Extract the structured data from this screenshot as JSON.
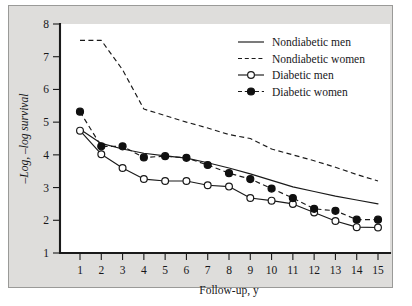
{
  "figure": {
    "background_color": "#dedddb",
    "plot_background_color": "#ffffff",
    "line_color": "#1a1a1a"
  },
  "chart_data": {
    "type": "line",
    "title": "",
    "xlabel": "Follow-up, y",
    "ylabel": "–Log, –log survival",
    "xlim": [
      1,
      15
    ],
    "ylim": [
      1,
      8
    ],
    "grid": false,
    "legend_position": "top-right",
    "x": [
      1,
      2,
      3,
      4,
      5,
      6,
      7,
      8,
      9,
      10,
      11,
      12,
      13,
      14,
      15
    ],
    "xticks": [
      "1",
      "2",
      "3",
      "4",
      "5",
      "6",
      "7",
      "8",
      "9",
      "10",
      "11",
      "12",
      "13",
      "14",
      "15"
    ],
    "yticks": [
      "1",
      "2",
      "3",
      "4",
      "5",
      "6",
      "7",
      "8"
    ],
    "series": [
      {
        "name": "Nondiabetic men",
        "style": "solid",
        "marker": "none",
        "values": [
          4.78,
          4.35,
          4.18,
          4.05,
          3.97,
          3.9,
          3.76,
          3.6,
          3.42,
          3.22,
          3.02,
          2.88,
          2.74,
          2.62,
          2.5
        ]
      },
      {
        "name": "Nondiabetic women",
        "style": "dashed",
        "marker": "none",
        "values": [
          7.5,
          7.5,
          6.6,
          5.4,
          5.2,
          5.0,
          4.82,
          4.62,
          4.5,
          4.18,
          4.0,
          3.82,
          3.62,
          3.4,
          3.2
        ]
      },
      {
        "name": "Diabetic men",
        "style": "solid",
        "marker": "open-circle",
        "values": [
          4.74,
          4.02,
          3.6,
          3.26,
          3.2,
          3.2,
          3.07,
          3.03,
          2.68,
          2.6,
          2.5,
          2.24,
          1.98,
          1.79,
          1.78
        ]
      },
      {
        "name": "Diabetic women",
        "style": "dashed",
        "marker": "filled-circle",
        "values": [
          5.32,
          4.26,
          4.26,
          3.92,
          3.96,
          3.91,
          3.69,
          3.44,
          3.26,
          2.97,
          2.68,
          2.35,
          2.29,
          2.02,
          2.02
        ]
      }
    ]
  }
}
